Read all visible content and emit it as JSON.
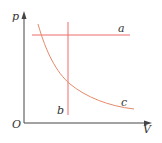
{
  "diagram": {
    "axes": {
      "y_label": "p",
      "x_label": "V",
      "origin_label": "O",
      "axis_color": "#444444"
    },
    "lines": [
      {
        "id": "a",
        "label": "a",
        "type": "horizontal",
        "description": "isobaric process (constant p)",
        "color": "#EE6A6A"
      },
      {
        "id": "b",
        "label": "b",
        "type": "vertical",
        "description": "isochoric process (constant V)",
        "color": "#EE6A6A"
      },
      {
        "id": "c",
        "label": "c",
        "type": "hyperbola",
        "description": "isothermal process (pV = const)",
        "color": "#E58A6A"
      }
    ]
  }
}
